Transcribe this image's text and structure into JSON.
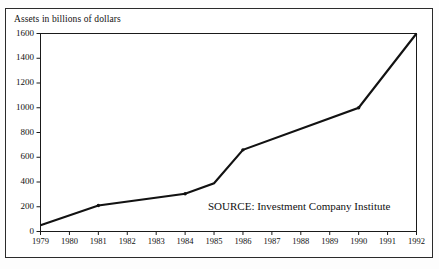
{
  "chart_data": {
    "type": "line",
    "title": "Assets in billions of dollars",
    "xlabel": "",
    "ylabel": "Assets in billions of dollars",
    "x": [
      1979,
      1980,
      1981,
      1982,
      1983,
      1984,
      1985,
      1986,
      1987,
      1988,
      1989,
      1990,
      1991,
      1992
    ],
    "values": [
      50,
      130,
      210,
      240,
      275,
      305,
      390,
      660,
      720,
      790,
      900,
      1000,
      1250,
      1600
    ],
    "series": [
      {
        "name": "Assets",
        "values": [
          50,
          130,
          210,
          240,
          275,
          305,
          390,
          660,
          720,
          790,
          900,
          1000,
          1250,
          1600
        ]
      }
    ],
    "vertices": [
      {
        "x": 1979,
        "y": 50
      },
      {
        "x": 1981,
        "y": 210
      },
      {
        "x": 1984,
        "y": 305
      },
      {
        "x": 1985,
        "y": 390
      },
      {
        "x": 1986,
        "y": 660
      },
      {
        "x": 1990,
        "y": 1000
      },
      {
        "x": 1992,
        "y": 1600
      }
    ],
    "markers": [
      1981,
      1984,
      1986,
      1990
    ],
    "xtick_labels": [
      "1979",
      "1980",
      "1981",
      "1982",
      "1983",
      "1984",
      "1985",
      "1986",
      "1987",
      "1988",
      "1989",
      "1990",
      "1991",
      "1992"
    ],
    "ytick_labels": [
      "0",
      "200",
      "400",
      "600",
      "800",
      "1000",
      "1200",
      "1400",
      "1600"
    ],
    "ytick_values": [
      0,
      200,
      400,
      600,
      800,
      1000,
      1200,
      1400,
      1600
    ],
    "ylim": [
      0,
      1600
    ],
    "xlim": [
      1979,
      1992
    ],
    "grid": false,
    "legend": false,
    "annotations": [
      {
        "name": "source-note",
        "text": "SOURCE: Investment Company Institute"
      }
    ],
    "colors": {
      "line": "#121212",
      "axis": "#1a1a1a",
      "frame": "#2b2b2b",
      "text": "#111111",
      "background": "#ffffff"
    }
  },
  "figure": {
    "title": "Assets in billions of dollars",
    "source": "SOURCE: Investment Company Institute"
  }
}
